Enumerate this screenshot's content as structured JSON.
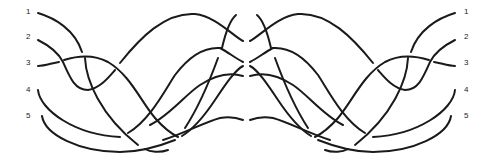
{
  "diagram": {
    "type": "braid",
    "strand_count": 5,
    "left_labels": [
      "1",
      "2",
      "3",
      "4",
      "5"
    ],
    "right_labels": [
      "1",
      "2",
      "3",
      "4",
      "5"
    ],
    "stroke_color": "#1a1a1a",
    "background": "#ffffff"
  }
}
